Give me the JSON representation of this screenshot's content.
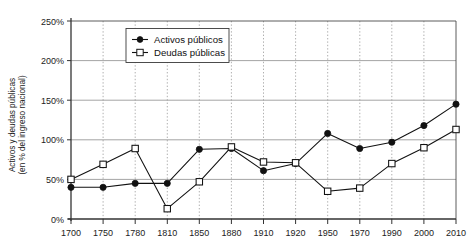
{
  "chart_data": {
    "type": "line",
    "title": "",
    "xlabel": "",
    "ylabel": "Activos y deudas públicas\n(en % del ingreso nacional)",
    "ylabel_line1": "Activos y deudas públicas",
    "ylabel_line2": "(en % del ingreso nacional)",
    "categories": [
      "1700",
      "1750",
      "1780",
      "1810",
      "1850",
      "1880",
      "1910",
      "1920",
      "1950",
      "1970",
      "1990",
      "2000",
      "2010"
    ],
    "ylim": [
      0,
      250
    ],
    "yticks": [
      0,
      50,
      100,
      150,
      200,
      250
    ],
    "ytick_labels": [
      "0%",
      "50%",
      "100%",
      "150%",
      "200%",
      "250%"
    ],
    "grid": "horizontal-solid-gray, vertical-dotted-gray",
    "legend_position": "top-left-inside",
    "series": [
      {
        "name": "Activos públicos",
        "marker": "filled-circle",
        "color": "#111111",
        "values": [
          40,
          40,
          45,
          45,
          88,
          89,
          61,
          70,
          108,
          89,
          97,
          118,
          145
        ]
      },
      {
        "name": "Deudas públicas",
        "marker": "open-square",
        "color": "#111111",
        "values": [
          50,
          69,
          89,
          13,
          47,
          91,
          72,
          71,
          35,
          39,
          70,
          90,
          113
        ]
      }
    ]
  },
  "legend": {
    "items": [
      {
        "label": "Activos públicos",
        "marker": "filled-circle"
      },
      {
        "label": "Deudas públicas",
        "marker": "open-square"
      }
    ]
  }
}
